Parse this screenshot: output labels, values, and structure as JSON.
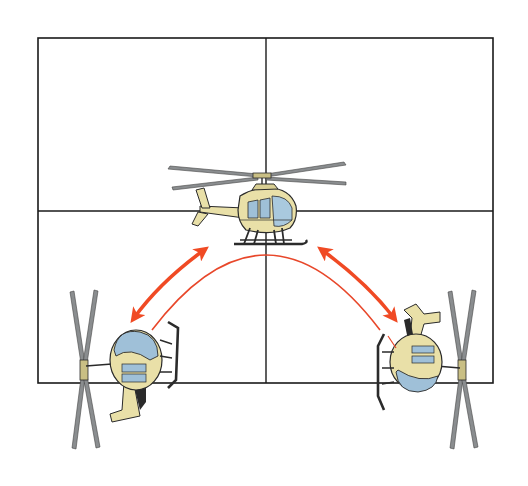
{
  "diagram": {
    "type": "illustration",
    "text_labels": [],
    "grid": {
      "frame": {
        "x": 38,
        "y": 38,
        "width": 455,
        "height": 345
      },
      "vertical_divider_x": 266,
      "horizontal_divider_y": 211,
      "quadrants": 4,
      "line_color": "#1a1a1a"
    },
    "helicopters": [
      {
        "id": "center",
        "view": "side-profile facing right",
        "position": "top-center",
        "cx": 266,
        "cy": 200
      },
      {
        "id": "left",
        "view": "rotated, nose up-left",
        "position": "bottom-left",
        "cx": 120,
        "cy": 360
      },
      {
        "id": "right",
        "view": "rotated, nose down-right",
        "position": "bottom-right",
        "cx": 420,
        "cy": 360
      }
    ],
    "arrows": [
      {
        "id": "left-double-arrow",
        "type": "double-headed",
        "from": "left helicopter",
        "to": "center helicopter"
      },
      {
        "id": "right-double-arrow",
        "type": "double-headed",
        "from": "center helicopter",
        "to": "right helicopter"
      },
      {
        "id": "arc-path",
        "type": "thin arc",
        "from": "left helicopter",
        "to": "right helicopter"
      }
    ],
    "colors": {
      "background": "#ffffff",
      "arrow": "#f04a24",
      "arc": "#e8472a",
      "fuselage": "#e9e0a8",
      "fuselage_shadow": "#c9bf84",
      "glass": "#9fc0d8",
      "rotor": "#8a8d8f",
      "outline": "#2a2a2a",
      "skid": "#2b2b2b"
    }
  }
}
